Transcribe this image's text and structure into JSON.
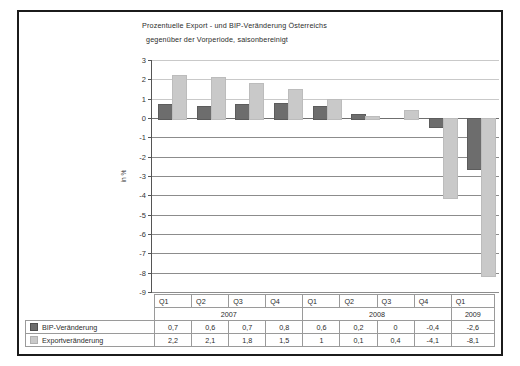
{
  "title": {
    "line1": "Prozentuelle Export - und BIP-Veränderung Österreichs",
    "line2": "gegenüber der Vorperiode, saisonbereinigt"
  },
  "axis": {
    "ylabel": "in %"
  },
  "legend": {
    "bip": "BIP-Veränderung",
    "export": "Exportveränderung",
    "bip_color": "#6d6d6d",
    "export_color": "#c9c9c9"
  },
  "table": {
    "quarters": [
      "Q1",
      "Q2",
      "Q3",
      "Q4",
      "Q1",
      "Q2",
      "Q3",
      "Q4",
      "Q1"
    ],
    "years": [
      {
        "label": "2007",
        "span": 4
      },
      {
        "label": "2008",
        "span": 4
      },
      {
        "label": "2009",
        "span": 1
      }
    ],
    "bip_values": [
      "0,7",
      "0,6",
      "0,7",
      "0,8",
      "0,6",
      "0,2",
      "0",
      "-0,4",
      "-2,6"
    ],
    "export_values": [
      "2,2",
      "2,1",
      "1,8",
      "1,5",
      "1",
      "0,1",
      "0,4",
      "-4,1",
      "-8,1"
    ]
  },
  "chart_data": {
    "type": "bar",
    "title": "Prozentuelle Export - und BIP-Veränderung Österreichs gegenüber der Vorperiode, saisonbereinigt",
    "xlabel": "",
    "ylabel": "in %",
    "ylim": [
      -9,
      3
    ],
    "yticks": [
      3,
      2,
      1,
      0,
      -1,
      -2,
      -3,
      -4,
      -5,
      -6,
      -7,
      -8,
      -9
    ],
    "ytick_labels": [
      "3",
      "2",
      "1",
      "0",
      "-1",
      "-2",
      "-3",
      "-4",
      "-5",
      "-6",
      "-7",
      "-8",
      "-9"
    ],
    "grid": true,
    "legend_position": "bottom-table",
    "categories": [
      "Q1 2007",
      "Q2 2007",
      "Q3 2007",
      "Q4 2007",
      "Q1 2008",
      "Q2 2008",
      "Q3 2008",
      "Q4 2008",
      "Q1 2009"
    ],
    "series": [
      {
        "name": "BIP-Veränderung",
        "color": "#6d6d6d",
        "values": [
          0.7,
          0.6,
          0.7,
          0.8,
          0.6,
          0.2,
          0,
          -0.4,
          -2.6
        ]
      },
      {
        "name": "Exportveränderung",
        "color": "#c9c9c9",
        "values": [
          2.2,
          2.1,
          1.8,
          1.5,
          1,
          0.1,
          0.4,
          -4.1,
          -8.1
        ]
      }
    ]
  }
}
